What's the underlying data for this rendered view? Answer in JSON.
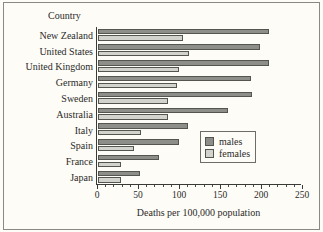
{
  "axis_header": "Country",
  "legend": {
    "males": {
      "label": "males",
      "color": "#8d8d89"
    },
    "females": {
      "label": "females",
      "color": "#d3d3cd"
    }
  },
  "chart_data": {
    "type": "bar",
    "orientation": "horizontal",
    "title": "",
    "xlabel": "Deaths per 100,000 population",
    "ylabel": "Country",
    "xlim": [
      0,
      250
    ],
    "xticks": [
      0,
      50,
      100,
      150,
      200,
      250
    ],
    "xticklabels": [
      "0",
      "50",
      "100",
      "150",
      "200",
      "250"
    ],
    "minor_tick_step": 10,
    "grid": false,
    "legend_position": "center right",
    "categories": [
      "New Zealand",
      "United States",
      "United Kingdom",
      "Germany",
      "Sweden",
      "Australia",
      "Italy",
      "Spain",
      "France",
      "Japan"
    ],
    "series": [
      {
        "name": "males",
        "color": "#8d8d89",
        "values": [
          208,
          197,
          209,
          186,
          188,
          159,
          110,
          99,
          74,
          51
        ]
      },
      {
        "name": "females",
        "color": "#d3d3cd",
        "values": [
          104,
          111,
          99,
          96,
          85,
          85,
          52,
          44,
          28,
          28
        ]
      }
    ]
  }
}
